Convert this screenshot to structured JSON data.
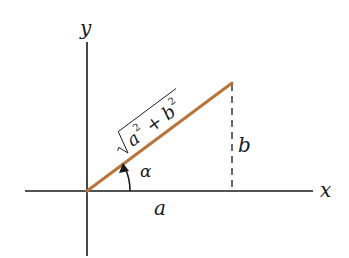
{
  "diagram": {
    "title": "",
    "axes": {
      "x_label": "x",
      "y_label": "y",
      "color": "#1a1a1a"
    },
    "vector": {
      "label_radicand": "a",
      "label_plus": "+",
      "label_b": "b",
      "label_exp_a": "2",
      "label_exp_b": "2",
      "color": "#B8743A"
    },
    "labels": {
      "horizontal_leg": "a",
      "vertical_leg": "b",
      "angle": "α"
    },
    "colors": {
      "background": "#ffffff",
      "ink": "#1a1a1a",
      "vector": "#B8743A"
    }
  }
}
